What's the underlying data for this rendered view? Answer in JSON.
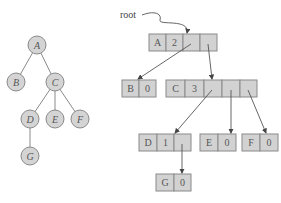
{
  "tree": {
    "nodes": [
      {
        "id": "A",
        "label": "A",
        "cx": 37,
        "cy": 45
      },
      {
        "id": "B",
        "label": "B",
        "cx": 16,
        "cy": 82
      },
      {
        "id": "C",
        "label": "C",
        "cx": 55,
        "cy": 82
      },
      {
        "id": "D",
        "label": "D",
        "cx": 30,
        "cy": 119
      },
      {
        "id": "E",
        "label": "E",
        "cx": 55,
        "cy": 119
      },
      {
        "id": "F",
        "label": "F",
        "cx": 80,
        "cy": 119
      },
      {
        "id": "G",
        "label": "G",
        "cx": 30,
        "cy": 156
      }
    ],
    "edges": [
      [
        "A",
        "B"
      ],
      [
        "A",
        "C"
      ],
      [
        "C",
        "D"
      ],
      [
        "C",
        "E"
      ],
      [
        "C",
        "F"
      ],
      [
        "D",
        "G"
      ]
    ]
  },
  "representation": {
    "root_label": "root",
    "records": [
      {
        "id": "A",
        "name": "A",
        "count": "2",
        "pointers": 2
      },
      {
        "id": "B",
        "name": "B",
        "count": "0",
        "pointers": 0
      },
      {
        "id": "C",
        "name": "C",
        "count": "3",
        "pointers": 3
      },
      {
        "id": "D",
        "name": "D",
        "count": "1",
        "pointers": 1
      },
      {
        "id": "E",
        "name": "E",
        "count": "0",
        "pointers": 0
      },
      {
        "id": "F",
        "name": "F",
        "count": "0",
        "pointers": 0
      },
      {
        "id": "G",
        "name": "G",
        "count": "0",
        "pointers": 0
      }
    ]
  }
}
